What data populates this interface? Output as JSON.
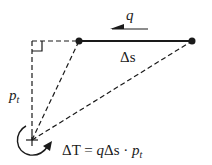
{
  "diagram": {
    "colors": {
      "background": "#ffffff",
      "stroke": "#1a1a1a"
    },
    "labels": {
      "shear_flow": "q",
      "element": "Δs",
      "perpendicular_distance_base": "p",
      "perpendicular_distance_sub": "t",
      "torque_formula_lhs": "ΔT",
      "torque_formula_eq": " = ",
      "torque_formula_rhs_q": "q",
      "torque_formula_rhs_ds": "Δs · ",
      "torque_formula_rhs_p": "p",
      "torque_formula_rhs_sub": "t"
    },
    "points": {
      "pivot": [
        32,
        140
      ],
      "node_left": [
        79,
        41
      ],
      "node_right": [
        192,
        41
      ],
      "foot": [
        32,
        41
      ]
    },
    "icons": {
      "shear_arrow": "arrow-left",
      "torque_arrow": "curved-arrow-counterclockwise"
    }
  }
}
